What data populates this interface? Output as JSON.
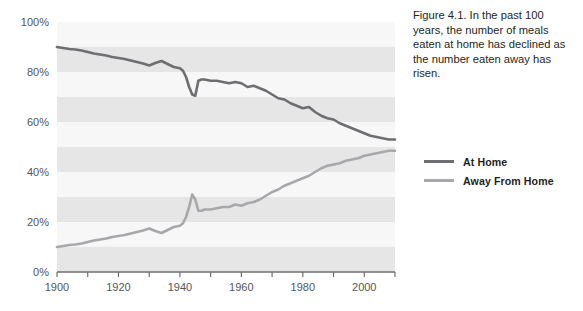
{
  "caption": {
    "text": "Figure 4.1. In the past 100 years, the number of meals eaten at home has declined as the number eaten away has risen."
  },
  "legend": {
    "items": [
      {
        "label": "At Home",
        "color": "#6e6e72"
      },
      {
        "label": "Away From Home",
        "color": "#a8a8ac"
      }
    ]
  },
  "axes": {
    "y_ticks": [
      "0%",
      "20%",
      "40%",
      "60%",
      "80%",
      "100%"
    ],
    "x_ticks": [
      "1900",
      "1920",
      "1940",
      "1960",
      "1980",
      "2000"
    ]
  },
  "chart_data": {
    "type": "line",
    "title": "",
    "xlabel": "",
    "ylabel": "",
    "xlim": [
      1900,
      2010
    ],
    "ylim": [
      0,
      100
    ],
    "grid": "horizontal-bands",
    "legend_position": "right",
    "x": [
      1900,
      1902,
      1904,
      1906,
      1908,
      1910,
      1912,
      1914,
      1916,
      1918,
      1920,
      1922,
      1924,
      1926,
      1928,
      1930,
      1932,
      1934,
      1936,
      1938,
      1940,
      1941,
      1942,
      1943,
      1944,
      1945,
      1946,
      1947,
      1948,
      1950,
      1952,
      1954,
      1956,
      1958,
      1960,
      1962,
      1964,
      1966,
      1968,
      1970,
      1972,
      1974,
      1976,
      1978,
      1980,
      1982,
      1984,
      1986,
      1988,
      1990,
      1992,
      1994,
      1996,
      1998,
      2000,
      2002,
      2004,
      2006,
      2008,
      2010
    ],
    "series": [
      {
        "name": "At Home",
        "color": "#6e6e72",
        "values": [
          90,
          89.6,
          89.2,
          89,
          88.6,
          88,
          87.4,
          87,
          86.6,
          86,
          85.6,
          85.2,
          84.6,
          84,
          83.4,
          82.6,
          83.6,
          84.4,
          83.2,
          82,
          81.5,
          80.5,
          78,
          74,
          71,
          70.5,
          76.5,
          77,
          77,
          76.5,
          76.5,
          76,
          75.5,
          76,
          75.5,
          74,
          74.5,
          73.5,
          72.5,
          71,
          69.5,
          69,
          67.5,
          66.5,
          65.5,
          66,
          64,
          62.5,
          61.5,
          61,
          59.5,
          58.5,
          57.5,
          56.5,
          55.5,
          54.5,
          54,
          53.5,
          53,
          53
        ]
      },
      {
        "name": "Away From Home",
        "color": "#a8a8ac",
        "values": [
          10,
          10.4,
          10.8,
          11,
          11.4,
          12,
          12.6,
          13,
          13.4,
          14,
          14.4,
          14.8,
          15.4,
          16,
          16.6,
          17.4,
          16.4,
          15.6,
          16.8,
          18,
          18.5,
          19.5,
          22,
          26,
          31,
          29,
          24.5,
          24.5,
          25,
          25,
          25.5,
          26,
          26,
          27,
          26.5,
          27.5,
          28,
          29,
          30.5,
          32,
          33,
          34.5,
          35.5,
          36.5,
          37.5,
          38.5,
          40,
          41.5,
          42.5,
          43,
          43.5,
          44.5,
          45,
          45.5,
          46.5,
          47,
          47.5,
          48,
          48.5,
          48.5
        ]
      }
    ]
  }
}
